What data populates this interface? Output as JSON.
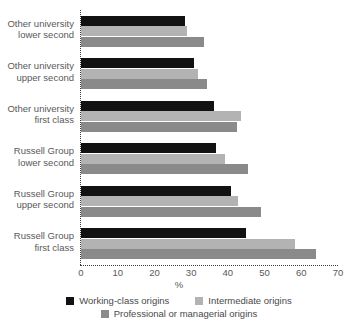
{
  "title_remnant": "",
  "chart_data": {
    "type": "bar",
    "orientation": "horizontal",
    "title": "",
    "xlabel": "%",
    "ylabel": "",
    "xlim": [
      0,
      70
    ],
    "xticks": [
      0,
      10,
      20,
      30,
      40,
      50,
      60,
      70
    ],
    "grid": false,
    "legend_position": "bottom",
    "categories": [
      "Other university lower second",
      "Other university upper second",
      "Other university first class",
      "Russell Group lower second",
      "Russell Group upper second",
      "Russell Group first class"
    ],
    "category_lines": [
      [
        "Other university",
        "lower second"
      ],
      [
        "Other university",
        "upper second"
      ],
      [
        "Other university",
        "first class"
      ],
      [
        "Russell Group",
        "lower second"
      ],
      [
        "Russell Group",
        "upper second"
      ],
      [
        "Russell Group",
        "first class"
      ]
    ],
    "series": [
      {
        "name": "Working-class origins",
        "color": "#121212",
        "values": [
          28.3,
          30.8,
          36.2,
          36.8,
          40.8,
          45.0
        ]
      },
      {
        "name": "Intermediate origins",
        "color": "#b3b3b3",
        "values": [
          29.0,
          32.0,
          43.6,
          39.2,
          42.8,
          58.3
        ]
      },
      {
        "name": "Professional or managerial origins",
        "color": "#8a8a8a",
        "values": [
          33.5,
          34.4,
          42.5,
          45.5,
          49.0,
          64.0
        ]
      }
    ]
  },
  "legend": {
    "row0": [
      {
        "label": "Working-class origins",
        "series": 0
      },
      {
        "label": "Intermediate origins",
        "series": 1
      }
    ],
    "row1": [
      {
        "label": "Professional or managerial origins",
        "series": 2
      }
    ]
  },
  "axis": {
    "x_unit_label": "%"
  }
}
